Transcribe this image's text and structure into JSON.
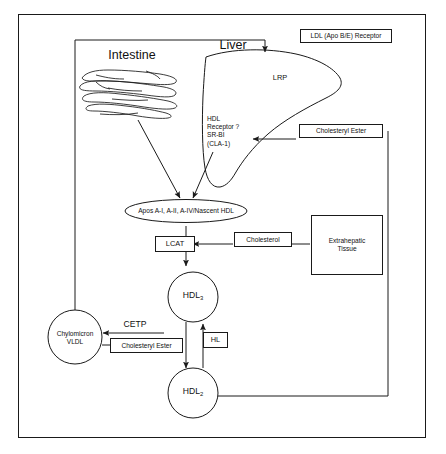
{
  "figure": {
    "background_color": "#ffffff",
    "line_color": "#1a1a1a",
    "text_color": "#111111"
  },
  "organs": {
    "intestine_label": "Intestine",
    "liver_label": "Liver",
    "liver_receptor_lrp": "LRP",
    "liver_hdl_receptor": "HDL\nReceptor ?\nSR-BI\n(CLA-1)"
  },
  "boxes": {
    "ldl_receptor": "LDL (Apo B/E) Receptor",
    "cholesteryl_ester_top": "Cholesteryl Ester",
    "cholesterol": "Cholesterol",
    "extrahepatic_tissue": "Extrahepatic\nTissue",
    "lcat": "LCAT",
    "cholesteryl_ester_bottom": "Cholesteryl Ester",
    "hl": "HL"
  },
  "nodes": {
    "apos_ellipse": "Apos A-I, A-II, A-IV/Nascent HDL",
    "hdl3_base": "HDL",
    "hdl3_sub": "3",
    "hdl2_base": "HDL",
    "hdl2_sub": "2",
    "chylomicron_vldl": "Chylomicron\nVLDL"
  },
  "enzymes": {
    "cetp": "CETP"
  }
}
